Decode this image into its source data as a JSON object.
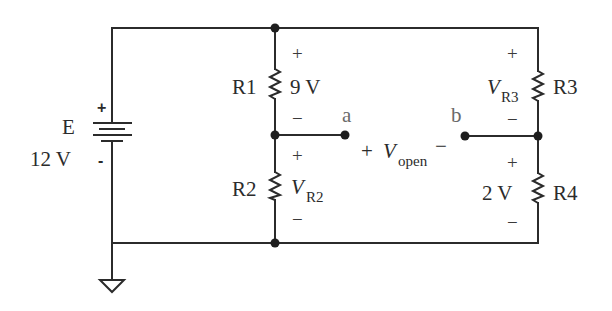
{
  "diagram": {
    "type": "circuit-schematic",
    "source": {
      "name": "E",
      "value": "12 V",
      "plus_sign": "+",
      "minus_sign": "-"
    },
    "resistors": [
      {
        "name": "R1",
        "voltage_label": "9 V",
        "plus": "+",
        "minus": "−"
      },
      {
        "name": "R2",
        "voltage_symbol": "V",
        "voltage_subscript": "R2",
        "plus": "+",
        "minus": "−"
      },
      {
        "name": "R3",
        "voltage_symbol": "V",
        "voltage_subscript": "R3",
        "plus": "+",
        "minus": "−"
      },
      {
        "name": "R4",
        "voltage_label": "2 V",
        "plus": "+",
        "minus": "−"
      }
    ],
    "terminals": {
      "a": "a",
      "b": "b"
    },
    "open_voltage": {
      "plus": "+",
      "symbol": "V",
      "subscript": "open",
      "minus": "−"
    },
    "ground": "ground-symbol",
    "colors": {
      "wire": "#2b2b2b",
      "node_label": "#6a6a6a",
      "background": "#ffffff"
    }
  }
}
